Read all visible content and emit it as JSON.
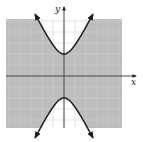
{
  "chart_data": {
    "type": "line",
    "title": "",
    "equation": "y^2/4 - x^2 = 1",
    "inequality": "y^2/4 - x^2 <= 1",
    "shaded_region": "outside the branches (containing origin)",
    "boundary_style": "solid",
    "xlabel": "x",
    "ylabel": "y",
    "xlim": [
      -5,
      5
    ],
    "ylim": [
      -5,
      5
    ],
    "grid": true,
    "grid_step": 1,
    "vertices": [
      [
        0,
        2
      ],
      [
        0,
        -2
      ]
    ],
    "asymptotes": [
      "y = 2x",
      "y = -2x"
    ],
    "series": [
      {
        "name": "upper branch",
        "x": [
          -2.6,
          -2,
          -1.5,
          -1,
          -0.5,
          0,
          0.5,
          1,
          1.5,
          2,
          2.6
        ],
        "y": [
          5.57,
          4.47,
          3.61,
          2.83,
          2.24,
          2.0,
          2.24,
          2.83,
          3.61,
          4.47,
          5.57
        ]
      },
      {
        "name": "lower branch",
        "x": [
          -2.6,
          -2,
          -1.5,
          -1,
          -0.5,
          0,
          0.5,
          1,
          1.5,
          2,
          2.6
        ],
        "y": [
          -5.57,
          -4.47,
          -3.61,
          -2.83,
          -2.24,
          -2.0,
          -2.24,
          -2.83,
          -3.61,
          -4.47,
          -5.57
        ]
      }
    ],
    "colors": {
      "shade": "#bdbdbd",
      "grid": "#d6d6d6",
      "curve": "#1e1e1e",
      "axis": "#333333",
      "inside": "#ffffff"
    }
  },
  "labels": {
    "x_axis": "x",
    "y_axis": "y"
  }
}
